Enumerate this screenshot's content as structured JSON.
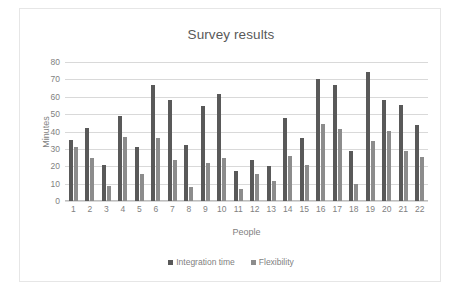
{
  "chart_data": {
    "type": "bar",
    "title": "Survey results",
    "xlabel": "People",
    "ylabel": "Minutes",
    "categories": [
      "1",
      "2",
      "3",
      "4",
      "5",
      "6",
      "7",
      "8",
      "9",
      "10",
      "11",
      "12",
      "13",
      "14",
      "15",
      "16",
      "17",
      "18",
      "19",
      "20",
      "21",
      "22"
    ],
    "series": [
      {
        "name": "Integration time",
        "color": "#595959",
        "values": [
          35,
          42,
          21,
          49,
          31,
          67,
          58,
          32,
          54.5,
          61.5,
          17.5,
          23.5,
          20,
          47.5,
          36,
          70,
          66.5,
          29,
          74.5,
          58,
          55.5,
          44
        ]
      },
      {
        "name": "Flexibility",
        "color": "#8c8c8c",
        "values": [
          31,
          25,
          8.5,
          37,
          15.5,
          36,
          23.5,
          8,
          22,
          24.5,
          7,
          15.5,
          11.5,
          26,
          21,
          44.5,
          41.5,
          10,
          34.5,
          40.5,
          29,
          25.5
        ]
      }
    ],
    "ylim": [
      0,
      80
    ],
    "yticks": [
      0,
      10,
      20,
      30,
      40,
      50,
      60,
      70,
      80
    ],
    "grid": true,
    "legend_position": "bottom"
  }
}
